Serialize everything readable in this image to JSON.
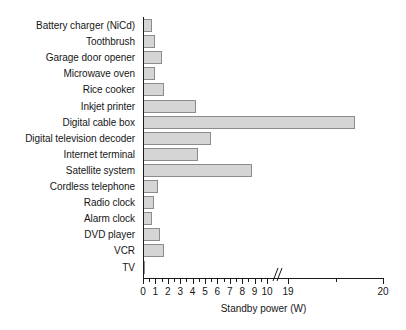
{
  "chart_data": {
    "type": "bar",
    "orientation": "horizontal",
    "title": "",
    "xlabel": "Standby power (W)",
    "ylabel": "",
    "xlim": [
      0,
      20
    ],
    "grid": false,
    "legend": false,
    "axis_break": {
      "from": 10,
      "to": 19,
      "label": "axis-break"
    },
    "xticks": [
      {
        "value": 0,
        "label": "0"
      },
      {
        "value": 1,
        "label": "1"
      },
      {
        "value": 2,
        "label": "2"
      },
      {
        "value": 3,
        "label": "3"
      },
      {
        "value": 4,
        "label": "4"
      },
      {
        "value": 5,
        "label": "5"
      },
      {
        "value": 6,
        "label": "6"
      },
      {
        "value": 7,
        "label": "7"
      },
      {
        "value": 8,
        "label": "8"
      },
      {
        "value": 9,
        "label": "9"
      },
      {
        "value": 10,
        "label": "10"
      },
      {
        "value": 19,
        "label": "19"
      },
      {
        "value": 20,
        "label": "20"
      }
    ],
    "categories": [
      "Battery charger (NiCd)",
      "Toothbrush",
      "Garage door opener",
      "Microwave oven",
      "Rice cooker",
      "Inkjet printer",
      "Digital cable box",
      "Digital television decoder",
      "Internet terminal",
      "Satellite system",
      "Cordless telephone",
      "Radio clock",
      "Alarm clock",
      "DVD player",
      "VCR",
      "TV"
    ],
    "values": [
      0.7,
      1.0,
      1.5,
      1.0,
      1.7,
      4.3,
      19.7,
      5.5,
      4.4,
      8.8,
      1.2,
      0.9,
      0.7,
      1.4,
      1.7,
      0.15
    ],
    "highlight_segment": {
      "category": "Digital cable box",
      "start": 13.4,
      "end": 14.4,
      "color": "#b4b4b4"
    },
    "colors": {
      "bar_fill": "#d5d5d5",
      "bar_edge": "#8c8c8c",
      "segment_fill": "#b4b4b4",
      "axis": "#1a1a1a",
      "text": "#161616",
      "background": "#ffffff"
    }
  }
}
